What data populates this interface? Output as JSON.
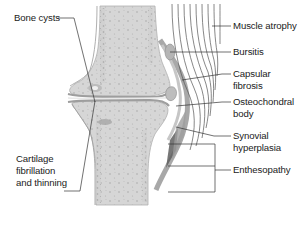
{
  "figure": {
    "colors": {
      "bone_fill": "#d9d9d9",
      "bone_outline": "#9a9a9a",
      "cartilage": "#bdbdbd",
      "capsule": "#a8a8a8",
      "muscle_lines": "#555555",
      "leader_lines": "#333333",
      "text": "#222222"
    }
  },
  "labels": {
    "bone_cysts": "Bone cysts",
    "cartilage": "Cartilage\nfibrillation\nand thinning",
    "muscle_atrophy": "Muscle atrophy",
    "bursitis": "Bursitis",
    "capsular_fibrosis": "Capsular\nfibrosis",
    "osteochondral_body": "Osteochondral\nbody",
    "synovial_hyperplasia": "Synovial\nhyperplasia",
    "enthesopathy": "Enthesopathy"
  }
}
